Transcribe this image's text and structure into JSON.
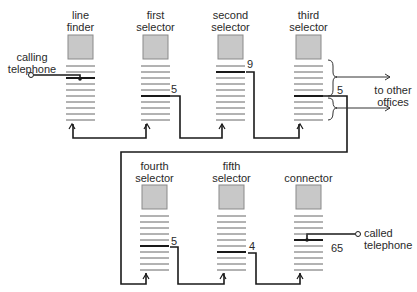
{
  "colors": {
    "box_fill": "#c8c8c8",
    "box_stroke": "#8a8a8a",
    "line": "#1a1a1a",
    "bank": "#555555"
  },
  "switches": [
    {
      "id": "line-finder",
      "label1": "line",
      "label2": "finder",
      "x": 68,
      "y": 35,
      "thick_index": 2,
      "digit": ""
    },
    {
      "id": "first-selector",
      "label1": "first",
      "label2": "selector",
      "x": 143,
      "y": 35,
      "thick_index": 5,
      "digit": "5"
    },
    {
      "id": "second-selector",
      "label1": "second",
      "label2": "selector",
      "x": 218,
      "y": 35,
      "thick_index": 1,
      "digit": "9"
    },
    {
      "id": "third-selector",
      "label1": "third",
      "label2": "selector",
      "x": 296,
      "y": 35,
      "thick_index": 5,
      "digit": "5"
    },
    {
      "id": "fourth-selector",
      "label1": "fourth",
      "label2": "selector",
      "x": 142,
      "y": 185,
      "thick_index": 5,
      "digit": "5"
    },
    {
      "id": "fifth-selector",
      "label1": "fifth",
      "label2": "selector",
      "x": 219,
      "y": 185,
      "thick_index": 6,
      "digit": "4"
    },
    {
      "id": "connector",
      "label1": "",
      "label2": "connector",
      "x": 296,
      "y": 185,
      "thick_index": 4,
      "digit": "65"
    }
  ],
  "terminals": {
    "calling": {
      "label1": "calling",
      "label2": "telephone"
    },
    "called": {
      "label1": "called",
      "label2": "telephone"
    }
  },
  "other_offices": {
    "label1": "to other",
    "label2": "offices"
  }
}
